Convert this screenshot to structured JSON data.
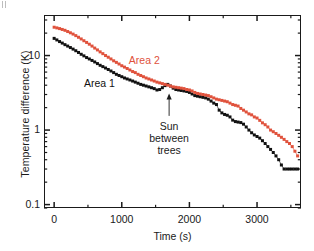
{
  "figure": {
    "corner_mark": "",
    "background": "#ffffff",
    "frame_color": "#1a1a1a"
  },
  "axes": {
    "x": {
      "label": "Time (s)",
      "ticks": [
        0,
        1000,
        2000,
        3000
      ],
      "tick_labels": [
        "0",
        "1000",
        "2000",
        "3000"
      ],
      "minor_ticks": [
        500,
        1500,
        2500,
        3500
      ],
      "min": -150,
      "max": 3650,
      "scale": "linear"
    },
    "y": {
      "label": "Temperature difference (K)",
      "ticks": [
        0.1,
        1,
        10
      ],
      "tick_labels": [
        "0.1",
        "1",
        "10"
      ],
      "min": 0.09,
      "max": 35,
      "scale": "log"
    }
  },
  "annotations": [
    {
      "name": "sun-between-trees",
      "lines": [
        "Sun",
        "between",
        "trees"
      ],
      "text": "Sun between trees",
      "arrow_from_t": 1700,
      "arrow_from_y": 1.55,
      "arrow_to_t": 1700,
      "arrow_to_y": 3.4
    }
  ],
  "series_labels": {
    "area1": "Area 1",
    "area2": "Area 2"
  },
  "colors": {
    "area1": "#111111",
    "area2": "#e0523c",
    "axis": "#1a1a1a",
    "annotation": "#1a1a1a"
  },
  "chart_data": {
    "type": "scatter",
    "title": "",
    "xlabel": "Time (s)",
    "ylabel": "Temperature difference (K)",
    "xlim": [
      -150,
      3650
    ],
    "ylim": [
      0.09,
      35
    ],
    "yscale": "log",
    "xscale": "linear",
    "grid": false,
    "legend": "inline-labels",
    "annotation": "Sun between trees",
    "series": [
      {
        "name": "Area 1",
        "color": "#111111",
        "marker": "square",
        "x": [
          0,
          40,
          80,
          120,
          160,
          200,
          240,
          280,
          320,
          360,
          400,
          440,
          480,
          520,
          560,
          600,
          640,
          680,
          720,
          760,
          800,
          840,
          880,
          920,
          960,
          1000,
          1040,
          1080,
          1120,
          1160,
          1200,
          1240,
          1280,
          1320,
          1360,
          1400,
          1440,
          1480,
          1520,
          1560,
          1600,
          1640,
          1680,
          1720,
          1760,
          1800,
          1840,
          1880,
          1920,
          1960,
          2000,
          2040,
          2080,
          2120,
          2160,
          2200,
          2240,
          2280,
          2320,
          2360,
          2400,
          2440,
          2480,
          2520,
          2560,
          2600,
          2640,
          2680,
          2720,
          2760,
          2800,
          2840,
          2880,
          2920,
          2960,
          3000,
          3040,
          3080,
          3120,
          3160,
          3200,
          3240,
          3280,
          3320,
          3360,
          3400,
          3440,
          3480,
          3520,
          3560,
          3600
        ],
        "y": [
          17.0,
          16.2,
          15.4,
          14.7,
          14.0,
          13.4,
          12.8,
          12.2,
          11.6,
          11.0,
          10.4,
          9.9,
          9.4,
          9.0,
          8.6,
          8.2,
          7.8,
          7.4,
          7.1,
          6.8,
          6.5,
          6.2,
          5.9,
          5.6,
          5.4,
          5.2,
          5.0,
          4.85,
          4.7,
          4.55,
          4.4,
          4.25,
          4.1,
          4.0,
          3.9,
          3.8,
          3.7,
          3.6,
          3.45,
          3.5,
          3.7,
          3.95,
          4.1,
          3.9,
          3.65,
          3.5,
          3.45,
          3.4,
          3.35,
          3.3,
          3.2,
          3.05,
          2.9,
          2.85,
          2.8,
          2.75,
          2.7,
          2.6,
          2.45,
          2.3,
          2.2,
          1.85,
          1.7,
          1.62,
          1.58,
          1.5,
          1.36,
          1.3,
          1.28,
          1.26,
          1.2,
          1.1,
          1.0,
          0.92,
          0.86,
          0.82,
          0.78,
          0.72,
          0.66,
          0.6,
          0.55,
          0.5,
          0.45,
          0.4,
          0.34,
          0.3,
          0.3,
          0.3,
          0.3,
          0.3,
          0.3
        ]
      },
      {
        "name": "Area 2",
        "color": "#e0523c",
        "marker": "square",
        "x": [
          0,
          40,
          80,
          120,
          160,
          200,
          240,
          280,
          320,
          360,
          400,
          440,
          480,
          520,
          560,
          600,
          640,
          680,
          720,
          760,
          800,
          840,
          880,
          920,
          960,
          1000,
          1040,
          1080,
          1120,
          1160,
          1200,
          1240,
          1280,
          1320,
          1360,
          1400,
          1440,
          1480,
          1520,
          1560,
          1600,
          1640,
          1680,
          1720,
          1760,
          1800,
          1840,
          1880,
          1920,
          1960,
          2000,
          2040,
          2080,
          2120,
          2160,
          2200,
          2240,
          2280,
          2320,
          2360,
          2400,
          2440,
          2480,
          2520,
          2560,
          2600,
          2640,
          2680,
          2720,
          2760,
          2800,
          2840,
          2880,
          2920,
          2960,
          3000,
          3040,
          3080,
          3120,
          3160,
          3200,
          3240,
          3280,
          3320,
          3360,
          3400,
          3440,
          3480,
          3520,
          3560,
          3600
        ],
        "y": [
          24.0,
          23.5,
          23.0,
          22.4,
          21.8,
          21.0,
          20.2,
          19.4,
          18.5,
          17.6,
          16.7,
          15.8,
          15.0,
          14.2,
          13.4,
          12.6,
          11.9,
          11.2,
          10.6,
          10.0,
          9.5,
          9.0,
          8.5,
          8.1,
          7.7,
          7.3,
          7.0,
          6.7,
          6.4,
          6.1,
          5.9,
          5.6,
          5.4,
          5.2,
          5.0,
          4.85,
          4.7,
          4.55,
          4.4,
          4.3,
          4.2,
          4.1,
          4.0,
          3.9,
          3.8,
          3.75,
          3.7,
          3.65,
          3.6,
          3.5,
          3.45,
          3.35,
          3.2,
          3.1,
          3.05,
          3.0,
          2.95,
          2.9,
          2.8,
          2.7,
          2.6,
          2.55,
          2.5,
          2.45,
          2.4,
          2.3,
          2.2,
          2.15,
          2.1,
          1.95,
          1.85,
          1.75,
          1.65,
          1.6,
          1.5,
          1.45,
          1.35,
          1.25,
          1.18,
          1.1,
          1.0,
          0.95,
          0.9,
          0.85,
          0.8,
          0.75,
          0.7,
          0.66,
          0.6,
          0.52,
          0.45
        ]
      }
    ]
  }
}
